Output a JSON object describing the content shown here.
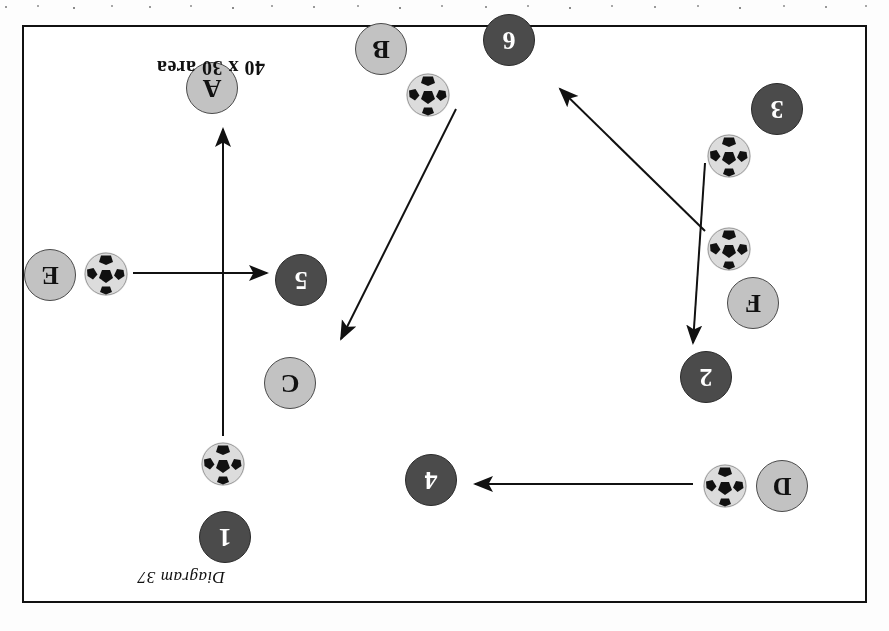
{
  "diagram": {
    "caption": "Diagram 37",
    "area_label": "40 x 30 area",
    "orientation": "rotated-180",
    "colors": {
      "dark_token": "#4b4b4b",
      "light_token": "#c2c2c2",
      "border": "#111111",
      "background": "#ffffff"
    }
  },
  "tokens": [
    {
      "label": "1",
      "type": "dark",
      "x": 614,
      "y": 38
    },
    {
      "label": "D",
      "type": "light",
      "x": 57,
      "y": 89
    },
    {
      "label": "4",
      "type": "dark",
      "x": 408,
      "y": 95
    },
    {
      "label": "C",
      "type": "light",
      "x": 549,
      "y": 192
    },
    {
      "label": "2",
      "type": "dark",
      "x": 133,
      "y": 198
    },
    {
      "label": "F",
      "type": "light",
      "x": 86,
      "y": 272
    },
    {
      "label": "5",
      "type": "dark",
      "x": 538,
      "y": 295
    },
    {
      "label": "E",
      "type": "light",
      "x": 789,
      "y": 300
    },
    {
      "label": "3",
      "type": "dark",
      "x": 62,
      "y": 466
    },
    {
      "label": "A",
      "type": "light",
      "x": 627,
      "y": 487
    },
    {
      "label": "B",
      "type": "light",
      "x": 458,
      "y": 526
    },
    {
      "label": "6",
      "type": "dark",
      "x": 330,
      "y": 535
    }
  ],
  "balls": [
    {
      "name": "ball-near-1",
      "x": 620,
      "y": 115
    },
    {
      "name": "ball-near-D",
      "x": 118,
      "y": 93
    },
    {
      "name": "ball-near-E",
      "x": 737,
      "y": 305
    },
    {
      "name": "ball-near-F",
      "x": 114,
      "y": 330
    },
    {
      "name": "ball-near-3",
      "x": 114,
      "y": 423
    },
    {
      "name": "ball-near-B",
      "x": 415,
      "y": 484
    }
  ],
  "arrows": [
    {
      "name": "pass-D-to-4",
      "x1": 172,
      "y1": 117,
      "x2": 390,
      "y2": 117
    },
    {
      "name": "pass-1-to-A",
      "x1": 642,
      "y1": 165,
      "x2": 642,
      "y2": 472
    },
    {
      "name": "pass-E-to-5",
      "x1": 732,
      "y1": 328,
      "x2": 598,
      "y2": 328
    },
    {
      "name": "pass-ball-to-C",
      "x1": 409,
      "y1": 492,
      "x2": 524,
      "y2": 262
    },
    {
      "name": "run-F-to-space",
      "x1": 160,
      "y1": 370,
      "x2": 305,
      "y2": 512
    },
    {
      "name": "run-3-to-2",
      "x1": 160,
      "y1": 438,
      "x2": 172,
      "y2": 258
    }
  ]
}
